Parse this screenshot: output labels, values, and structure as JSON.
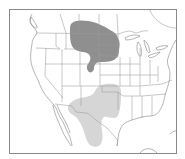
{
  "map": {
    "type": "species-range-map",
    "region": "Western and central North America (United States, southern Canada, northern Mexico)",
    "background_color": "#ffffff",
    "frame_color": "#8a8a8a",
    "border_color": "#9a9a9a",
    "ranges": [
      {
        "name": "northern-range",
        "description": "Dark shaded range across southern Saskatchewan/Manitoba, Montana, North Dakota, South Dakota, northern Nebraska",
        "color": "#8f8f8f"
      },
      {
        "name": "southern-range",
        "description": "Light shaded range across New Mexico, west Texas, Oklahoma panhandle and northern Mexico",
        "color": "#d6d6d6"
      }
    ]
  }
}
